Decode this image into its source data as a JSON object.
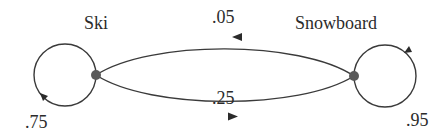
{
  "diagram": {
    "type": "state-transition",
    "nodes": [
      {
        "id": "ski",
        "label": "Ski"
      },
      {
        "id": "snowboard",
        "label": "Snowboard"
      }
    ],
    "edges": [
      {
        "from": "snowboard",
        "to": "ski",
        "probability": ".05"
      },
      {
        "from": "ski",
        "to": "snowboard",
        "probability": ".25"
      },
      {
        "from": "ski",
        "to": "ski",
        "probability": ".75"
      },
      {
        "from": "snowboard",
        "to": "snowboard",
        "probability": ".95"
      }
    ],
    "colors": {
      "stroke": "#3a3a3a",
      "node": "#5a5a5a",
      "text": "#2b2b2b"
    }
  }
}
